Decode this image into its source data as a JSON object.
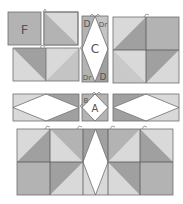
{
  "colors": {
    "light": "#d9d9d9",
    "medium": "#b3b3b3",
    "dark": "#a0a0a0",
    "white": "#ffffff",
    "stroke": "#6e6e6e"
  },
  "labels": {
    "f": "F",
    "c": "C",
    "a": "A",
    "b": "B",
    "d_top_left": "D",
    "dr_top_right": "Dr",
    "dr_bottom_left": "Dr",
    "d_bottom_right": "D"
  },
  "diagram": {
    "pieces": [
      "F",
      "C",
      "A",
      "B",
      "D",
      "Dr"
    ]
  }
}
